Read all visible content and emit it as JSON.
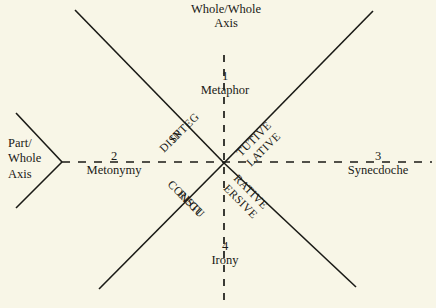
{
  "figure": {
    "background_color": "#f8f6e7",
    "ink_color": "#1a1a16",
    "type": "quadrant-diagram"
  },
  "axes": {
    "vertical": {
      "label": "Whole/Whole\nAxis",
      "label_line1": "Whole/Whole",
      "label_line2": "Axis",
      "style": "dashed"
    },
    "horizontal": {
      "label_line1": "Part/",
      "label_line2": "Whole",
      "label_line3": "Axis",
      "style": "dashed"
    }
  },
  "poles": [
    {
      "number": "1",
      "name": "Metaphor",
      "position": "top"
    },
    {
      "number": "2",
      "name": "Metonymy",
      "position": "left"
    },
    {
      "number": "3",
      "name": "Synecdoche",
      "position": "right"
    },
    {
      "number": "4",
      "name": "Irony",
      "position": "bottom"
    }
  ],
  "diagonal_labels": [
    {
      "text": "INTEG",
      "arm": "upper-left",
      "side": "above"
    },
    {
      "text": "DISP",
      "arm": "upper-left",
      "side": "below"
    },
    {
      "text": "TUTIVE",
      "arm": "upper-right",
      "side": "above"
    },
    {
      "text": "LATIVE",
      "arm": "upper-right",
      "side": "below"
    },
    {
      "text": "CONSTI",
      "arm": "lower-left",
      "side": "above"
    },
    {
      "text": "REGU",
      "arm": "lower-left",
      "side": "below"
    },
    {
      "text": "RATIVE",
      "arm": "lower-right",
      "side": "above"
    },
    {
      "text": "ERSIVE",
      "arm": "lower-right",
      "side": "below"
    }
  ]
}
